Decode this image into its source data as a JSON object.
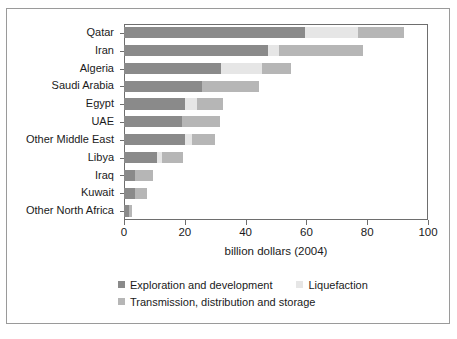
{
  "chart_data": {
    "type": "bar",
    "orientation": "horizontal",
    "stacked": true,
    "title": "",
    "xlabel": "billion dollars (2004)",
    "ylabel": "",
    "xlim": [
      0,
      100
    ],
    "xticks": [
      0,
      20,
      40,
      60,
      80,
      100
    ],
    "xtick_labels": [
      "0",
      "20",
      "40",
      "60",
      "80",
      "100"
    ],
    "grid": false,
    "legend_position": "below",
    "categories": [
      "Qatar",
      "Iran",
      "Algeria",
      "Saudi Arabia",
      "Egypt",
      "UAE",
      "Other Middle East",
      "Libya",
      "Iraq",
      "Kuwait",
      "Other North Africa"
    ],
    "series": [
      {
        "name": "Exploration and development",
        "color": "#8a8a8a",
        "values": [
          59.5,
          47.5,
          32.0,
          25.5,
          20.0,
          19.0,
          20.0,
          11.0,
          3.5,
          3.5,
          1.5
        ]
      },
      {
        "name": "Liquefaction",
        "color": "#e6e6e6",
        "values": [
          17.5,
          3.5,
          13.5,
          0.0,
          4.0,
          0.0,
          2.5,
          1.5,
          0.0,
          0.0,
          0.0
        ]
      },
      {
        "name": "Transmission, distribution and storage",
        "color": "#b6b6b6",
        "values": [
          15.0,
          27.5,
          9.5,
          19.0,
          8.5,
          12.5,
          7.5,
          7.0,
          6.0,
          4.0,
          1.0
        ]
      }
    ],
    "totals": [
      92.0,
      78.5,
      55.0,
      44.5,
      32.5,
      31.5,
      30.0,
      19.5,
      9.5,
      7.5,
      2.5
    ]
  },
  "legend": {
    "entries": [
      {
        "label": "Exploration and development",
        "color": "#8a8a8a"
      },
      {
        "label": "Liquefaction",
        "color": "#e6e6e6"
      },
      {
        "label": "Transmission, distribution and storage",
        "color": "#b6b6b6"
      }
    ]
  },
  "axes": {
    "x_title": "billion dollars (2004)"
  },
  "colors": {
    "frame": "#9a9a9a",
    "axis": "#6e6e6e",
    "text": "#1a1a1a",
    "background": "#ffffff"
  }
}
